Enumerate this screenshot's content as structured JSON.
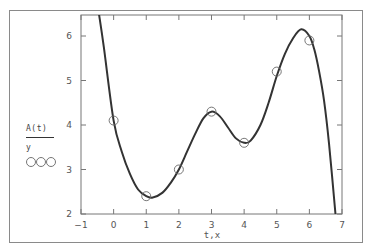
{
  "chart_data": {
    "type": "line",
    "title": "",
    "xlabel": "t,x",
    "ylabel": "",
    "xlim": [
      -1,
      7
    ],
    "ylim": [
      2,
      6.5
    ],
    "x_ticks": [
      "-1",
      "0",
      "1",
      "2",
      "3",
      "4",
      "5",
      "6",
      "7"
    ],
    "y_ticks": [
      "2",
      "3",
      "4",
      "5",
      "6"
    ],
    "grid": false,
    "legend_position": "left",
    "series": [
      {
        "name": "A(t)",
        "style": "solid line",
        "color": "#333333",
        "x": [
          -0.45,
          -0.3,
          0,
          0.25,
          0.5,
          0.75,
          1,
          1.2,
          1.5,
          1.75,
          2,
          2.25,
          2.5,
          2.75,
          3,
          3.25,
          3.5,
          3.75,
          4,
          4.2,
          4.5,
          4.75,
          5,
          5.25,
          5.5,
          5.75,
          6,
          6.15,
          6.3,
          6.45,
          6.6,
          6.8
        ],
        "values": [
          6.5,
          5.75,
          4.1,
          3.4,
          2.9,
          2.55,
          2.4,
          2.37,
          2.48,
          2.7,
          3.0,
          3.4,
          3.8,
          4.15,
          4.3,
          4.2,
          3.95,
          3.7,
          3.6,
          3.65,
          4.0,
          4.5,
          5.1,
          5.6,
          5.95,
          6.15,
          6.0,
          5.7,
          5.2,
          4.55,
          3.6,
          2.0
        ]
      },
      {
        "name": "y",
        "style": "circle markers",
        "color": "#666666",
        "x": [
          0,
          1,
          2,
          3,
          4,
          5,
          6
        ],
        "values": [
          4.1,
          2.4,
          3.0,
          4.3,
          3.6,
          5.2,
          5.9
        ]
      }
    ]
  },
  "legend": {
    "line_label": "A(t)",
    "marker_label": "y",
    "marker_symbol": "○○○"
  }
}
